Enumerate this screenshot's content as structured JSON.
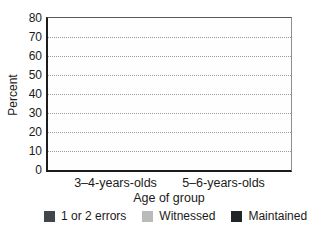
{
  "chart_data": {
    "type": "bar",
    "title": "",
    "xlabel": "Age of group",
    "ylabel": "Percent",
    "ylim": [
      0,
      80
    ],
    "yticks": [
      0,
      10,
      20,
      30,
      40,
      50,
      60,
      70,
      80
    ],
    "grid": "horizontal dotted",
    "legend_position": "bottom",
    "categories": [
      "3–4-years-olds",
      "5–6-years-olds"
    ],
    "series": [
      {
        "name": "1 or 2 errors",
        "color": "#41464a",
        "values": [
          72,
          38
        ]
      },
      {
        "name": "Witnessed",
        "color": "#b8bbb8",
        "values": [
          43,
          13
        ]
      },
      {
        "name": "Maintained",
        "color": "#222527",
        "values": [
          21,
          8
        ]
      }
    ]
  },
  "colors": {
    "gridline": "#9a9a9a",
    "axis": "#1c1c1c",
    "text": "#1a1a1a",
    "background": "#ffffff"
  }
}
